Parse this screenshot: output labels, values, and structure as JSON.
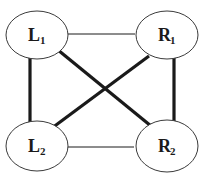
{
  "diagram": {
    "type": "graph",
    "colors": {
      "node_stroke": "#3a3a3a",
      "edge": "#1a1a1a",
      "background": "#ffffff"
    },
    "nodes": [
      {
        "id": "L1",
        "letter": "L",
        "subscript": "1",
        "cx": 37,
        "cy": 35,
        "rx": 31,
        "ry": 24
      },
      {
        "id": "R1",
        "letter": "R",
        "subscript": "1",
        "cx": 167,
        "cy": 35,
        "rx": 31,
        "ry": 24
      },
      {
        "id": "L2",
        "letter": "L",
        "subscript": "2",
        "cx": 37,
        "cy": 146,
        "rx": 31,
        "ry": 25
      },
      {
        "id": "R2",
        "letter": "R",
        "subscript": "2",
        "cx": 167,
        "cy": 146,
        "rx": 31,
        "ry": 26
      }
    ],
    "edges": [
      {
        "from": "L1",
        "to": "R1",
        "weight": "thin",
        "x1": 68,
        "y1": 34,
        "x2": 135,
        "y2": 34
      },
      {
        "from": "L2",
        "to": "R2",
        "weight": "thin",
        "x1": 62,
        "y1": 147,
        "x2": 134,
        "y2": 147
      },
      {
        "from": "L1",
        "to": "L2",
        "weight": "thick",
        "x1": 30,
        "y1": 57,
        "x2": 30,
        "y2": 125
      },
      {
        "from": "R1",
        "to": "R2",
        "weight": "thick",
        "x1": 174,
        "y1": 57,
        "x2": 174,
        "y2": 125
      },
      {
        "from": "L1",
        "to": "R2",
        "weight": "thick",
        "x1": 58,
        "y1": 50,
        "x2": 151,
        "y2": 126
      },
      {
        "from": "R1",
        "to": "L2",
        "weight": "thick",
        "x1": 149,
        "y1": 56,
        "x2": 52,
        "y2": 128
      }
    ]
  }
}
